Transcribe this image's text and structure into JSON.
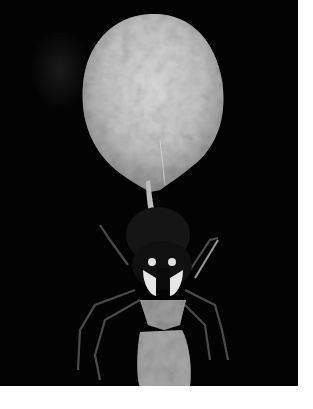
{
  "image": {
    "subject": "spider carrying egg sac",
    "style": "black-and-white photograph",
    "colors": {
      "background": "#030303",
      "egg_sac": "#cfcfcf",
      "egg_sac_shadow": "#8a8a8a",
      "body_highlight": "#e6e6e6",
      "border": "#ffffff"
    }
  }
}
